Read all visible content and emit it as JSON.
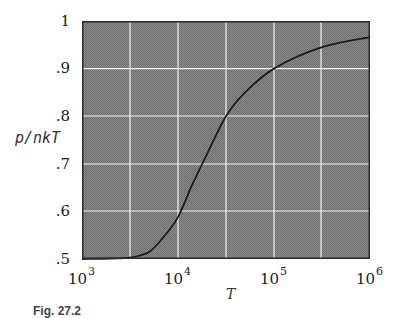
{
  "chart_data": {
    "type": "line",
    "title": "",
    "xlabel": "T",
    "ylabel": "p/nkT",
    "xscale": "log",
    "xlim": [
      1000,
      1000000
    ],
    "ylim": [
      0.5,
      1.0
    ],
    "grid": true,
    "x_ticks": [
      "10^3",
      "10^4",
      "10^5",
      "10^6"
    ],
    "y_ticks": [
      ".5",
      ".6",
      ".7",
      ".8",
      ".9",
      "1"
    ],
    "series": [
      {
        "name": "p/nkT vs T",
        "x": [
          1000,
          2000,
          3162,
          5000,
          7000,
          10000,
          14000,
          20000,
          31623,
          50000,
          100000,
          316228,
          1000000
        ],
        "y": [
          0.5,
          0.501,
          0.503,
          0.515,
          0.545,
          0.588,
          0.655,
          0.72,
          0.8,
          0.85,
          0.9,
          0.945,
          0.966
        ]
      }
    ],
    "caption": "Fig. 27.2"
  },
  "axes": {
    "ylabel": "p/nkT",
    "xlabel": "T",
    "yticks": [
      {
        "label": "1",
        "top": 12
      },
      {
        "label": ".9",
        "top": 59
      },
      {
        "label": ".8",
        "top": 107
      },
      {
        "label": ".7",
        "top": 155
      },
      {
        "label": ".6",
        "top": 202
      },
      {
        "label": ".5",
        "top": 250
      }
    ],
    "xticks": [
      {
        "base": "10",
        "exp": "3"
      },
      {
        "base": "10",
        "exp": "4"
      },
      {
        "base": "10",
        "exp": "5"
      },
      {
        "base": "10",
        "exp": "6"
      }
    ]
  },
  "caption": "Fig. 27.2"
}
